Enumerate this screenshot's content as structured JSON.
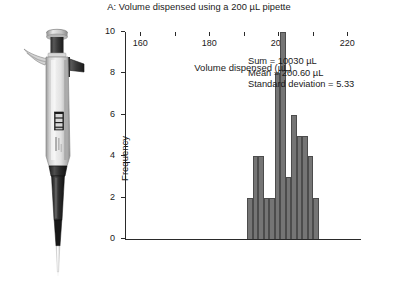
{
  "figure": {
    "title": "A: Volume dispensed using a 200 µL pipette"
  },
  "photo": {
    "caption": "pipette-photograph",
    "alt": "Single-channel adjustable micropipette"
  },
  "annotations": {
    "sum": "Sum = 10030 µL",
    "mean": "Mean = 200.60 µL",
    "stdev": "Standard deviation = 5.33"
  },
  "chart_data": {
    "type": "bar",
    "title": "A: Volume dispensed using a 200 µL pipette",
    "xlabel": "Volume dispensed (µL)",
    "ylabel": "Frequency",
    "xlim": [
      155.6,
      224.0
    ],
    "ylim": [
      0,
      10
    ],
    "xticks": [
      160,
      180,
      200,
      220
    ],
    "xtick_labels": [
      "160",
      "180",
      "200",
      "220"
    ],
    "xminorticks": [
      170,
      190,
      210
    ],
    "yticks": [
      0,
      2,
      4,
      6,
      8,
      10
    ],
    "ytick_labels": [
      "0",
      "2",
      "4",
      "6",
      "8",
      "10"
    ],
    "grid": false,
    "legend": null,
    "bin_width": 1.6,
    "bar_color": "#757575",
    "bar_edge_color": "#4c4c4c",
    "categories": [
      "191.0",
      "192.6",
      "194.2",
      "195.8",
      "197.4",
      "199.0",
      "200.6",
      "202.2",
      "203.8",
      "205.4",
      "207.0",
      "208.6",
      "210.2"
    ],
    "bin_starts": [
      191.0,
      192.6,
      194.2,
      195.8,
      197.4,
      199.0,
      200.6,
      202.2,
      203.8,
      205.4,
      207.0,
      208.6,
      210.2
    ],
    "values": [
      2,
      4,
      4,
      2,
      2,
      8,
      10,
      3,
      6,
      5,
      5,
      4,
      2
    ],
    "n_observations": 50,
    "sum": 10030,
    "mean": 200.6,
    "standard_deviation": 5.33
  },
  "colors": {
    "bar": "#757575",
    "bar_edge": "#4c4c4c",
    "axis": "#2a2a2a",
    "text": "#1a1a1a",
    "background": "#ffffff"
  }
}
